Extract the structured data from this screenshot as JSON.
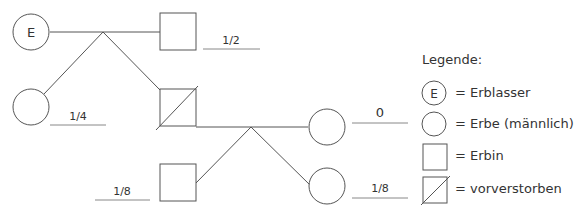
{
  "diagram": {
    "type": "family-tree-inheritance",
    "nodes": [
      {
        "id": "erblasser",
        "shape": "circle",
        "label": "E",
        "share": ""
      },
      {
        "id": "tochter-oben",
        "shape": "square",
        "share_num": "1",
        "share_den": "2"
      },
      {
        "id": "sohn-links",
        "shape": "circle",
        "share_num": "1",
        "share_den": "4"
      },
      {
        "id": "verstorben",
        "shape": "square-crossed",
        "share": ""
      },
      {
        "id": "sohn-rechts",
        "shape": "circle",
        "share": "0"
      },
      {
        "id": "enkelin",
        "shape": "square",
        "share_num": "1",
        "share_den": "8"
      },
      {
        "id": "enkel",
        "shape": "circle",
        "share_num": "1",
        "share_den": "8"
      }
    ]
  },
  "legend": {
    "title": "Legende:",
    "e_glyph": "E",
    "items": [
      {
        "label": "= Erblasser"
      },
      {
        "label": "= Erbe (männlich)"
      },
      {
        "label": "= Erbin"
      },
      {
        "label": "= vorverstorben"
      }
    ]
  }
}
